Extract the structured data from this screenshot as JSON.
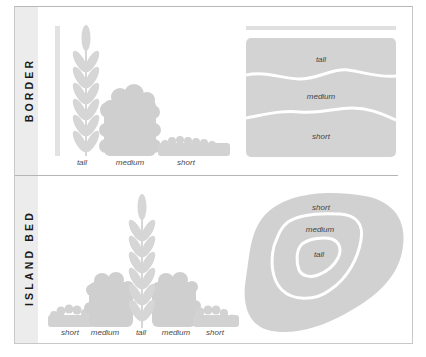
{
  "sections": [
    {
      "id": "border",
      "title": "BORDER",
      "plant_labels": [
        "tall",
        "medium",
        "short"
      ],
      "diagram_labels": [
        "tall",
        "medium",
        "short"
      ]
    },
    {
      "id": "island-bed",
      "title": "ISLAND BED",
      "plant_labels": [
        "short",
        "medium",
        "tall",
        "medium",
        "short"
      ],
      "diagram_labels": [
        "short",
        "medium",
        "tall"
      ]
    }
  ],
  "colors": {
    "plant_fill": "#d4d4d4",
    "zone_fill": "#d0d0d0",
    "stripe": "#ececec",
    "divider": "#b5b5b5",
    "label_text": "#1a1a1a"
  }
}
